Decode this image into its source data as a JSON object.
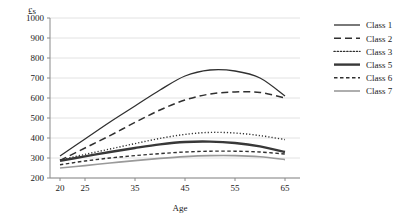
{
  "chart_data": {
    "type": "line",
    "title": "",
    "xlabel": "Age",
    "ylabel": "£s",
    "x": [
      20,
      25,
      30,
      35,
      40,
      45,
      50,
      55,
      60,
      65
    ],
    "xticks": [
      20,
      25,
      35,
      45,
      55,
      65
    ],
    "yticks": [
      200,
      300,
      400,
      500,
      600,
      700,
      800,
      900,
      1000
    ],
    "xlim": [
      18,
      68
    ],
    "ylim": [
      200,
      1000
    ],
    "grid": "horizontal",
    "legend_position": "right",
    "series": [
      {
        "name": "Class 1",
        "style": "solid",
        "color": "#303030",
        "width": 1.3,
        "values": [
          310,
          395,
          480,
          560,
          640,
          710,
          740,
          735,
          700,
          610
        ]
      },
      {
        "name": "Class 2",
        "style": "long-dash",
        "color": "#303030",
        "width": 1.5,
        "values": [
          288,
          350,
          412,
          478,
          540,
          590,
          620,
          630,
          628,
          600
        ]
      },
      {
        "name": "Class 3",
        "style": "dotted",
        "color": "#303030",
        "width": 1.4,
        "values": [
          290,
          318,
          345,
          372,
          398,
          418,
          428,
          425,
          412,
          392
        ]
      },
      {
        "name": "Class 5",
        "style": "thick-solid",
        "color": "#383838",
        "width": 2.4,
        "values": [
          286,
          308,
          330,
          350,
          368,
          380,
          382,
          375,
          358,
          330
        ]
      },
      {
        "name": "Class 6",
        "style": "short-dash",
        "color": "#303030",
        "width": 1.4,
        "values": [
          266,
          285,
          300,
          312,
          322,
          330,
          334,
          334,
          330,
          320
        ]
      },
      {
        "name": "Class 7",
        "style": "solid-grey",
        "color": "#9a9a9a",
        "width": 1.6,
        "values": [
          250,
          262,
          275,
          287,
          298,
          307,
          312,
          312,
          306,
          292
        ]
      }
    ]
  },
  "axis": {
    "y_unit_label": "£s",
    "x_axis_label": "Age"
  }
}
